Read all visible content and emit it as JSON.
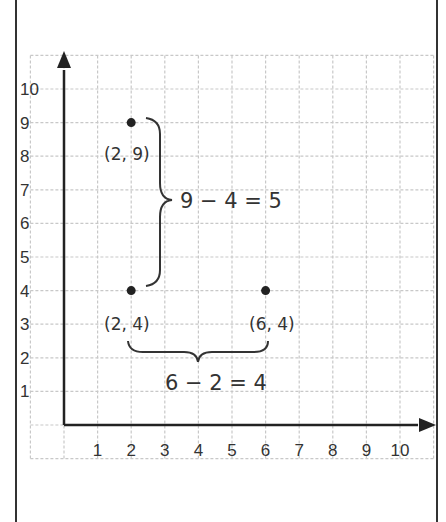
{
  "diagram": {
    "type": "coordinate-grid",
    "x_axis": {
      "ticks": [
        "1",
        "2",
        "3",
        "4",
        "5",
        "6",
        "7",
        "8",
        "9",
        "10"
      ]
    },
    "y_axis": {
      "ticks": [
        "1",
        "2",
        "3",
        "4",
        "5",
        "6",
        "7",
        "8",
        "9",
        "10"
      ]
    },
    "points": [
      {
        "x": 2,
        "y": 9,
        "label": "(2, 9)"
      },
      {
        "x": 2,
        "y": 4,
        "label": "(2, 4)"
      },
      {
        "x": 6,
        "y": 4,
        "label": "(6, 4)"
      }
    ],
    "annotations": {
      "vertical_distance": "9 − 4 = 5",
      "horizontal_distance": "6 − 2 = 4"
    },
    "colors": {
      "grid": "#c8c8c8",
      "axis": "#222222",
      "point": "#222222",
      "text": "#333333",
      "border": "#333333"
    }
  },
  "chart_data": {
    "type": "scatter",
    "title": "",
    "xlabel": "",
    "ylabel": "",
    "xlim": [
      0,
      10
    ],
    "ylim": [
      0,
      10
    ],
    "grid": true,
    "x": [
      2,
      2,
      6
    ],
    "y": [
      9,
      4,
      4
    ],
    "point_labels": [
      "(2, 9)",
      "(2, 4)",
      "(6, 4)"
    ],
    "annotations": [
      "9 − 4 = 5",
      "6 − 2 = 4"
    ]
  }
}
